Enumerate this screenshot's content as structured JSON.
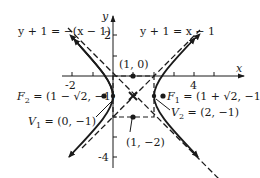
{
  "diagram": {
    "type": "hyperbola-graph",
    "equation_form": "(x-1)^2 - (y+1)^2 = 1",
    "axes": {
      "x_label": "x",
      "y_label": "y",
      "x_ticks": [
        {
          "value": -2,
          "label": "-2"
        },
        {
          "value": 4,
          "label": "4"
        }
      ],
      "y_ticks": [
        {
          "value": 2,
          "label": "2"
        },
        {
          "value": -4,
          "label": "-4"
        }
      ]
    },
    "asymptotes": [
      {
        "label": "y + 1 = −(x − 1)",
        "slope": -1
      },
      {
        "label": "y + 1 = x − 1",
        "slope": 1
      }
    ],
    "points": {
      "top_midpoint": {
        "label": "(1, 0)"
      },
      "focus_left": {
        "label": "F₂ = (1 − √2, −1)",
        "sub": "2",
        "name": "F",
        "coords": "(1 − √2, −1)"
      },
      "focus_right": {
        "label": "F₁ = (1 + √2, −1)",
        "sub": "1",
        "name": "F",
        "coords": "(1 + √2, −1)"
      },
      "vertex_left": {
        "label": "V₁ = (0, −1)",
        "sub": "1",
        "name": "V",
        "coords": "(0, −1)"
      },
      "vertex_right": {
        "label": "V₂ = (2, −1)",
        "sub": "2",
        "name": "V",
        "coords": "(2, −1)"
      },
      "bottom_midpoint": {
        "label": "(1, −2)"
      }
    },
    "colors": {
      "ink": "#1a1a1a",
      "background": "#ffffff"
    }
  }
}
